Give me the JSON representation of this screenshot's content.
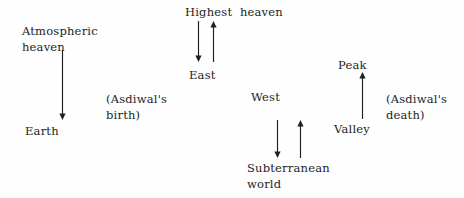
{
  "diagram": {
    "title_text": "",
    "background_color": "#fefefe",
    "ink_color": "#1d1d1d",
    "labels": [
      {
        "id": "atmospheric_heaven",
        "text": "Atmospheric\nheaven",
        "x": 22,
        "y": 24
      },
      {
        "id": "earth",
        "text": "Earth",
        "x": 25,
        "y": 124
      },
      {
        "id": "highest_heaven",
        "text": "Highest  heaven",
        "x": 185,
        "y": 5
      },
      {
        "id": "east",
        "text": "East",
        "x": 189,
        "y": 68
      },
      {
        "id": "asdiwal_birth",
        "text": "(Asdiwal's\nbirth)",
        "x": 106,
        "y": 92
      },
      {
        "id": "west",
        "text": "West",
        "x": 251,
        "y": 90
      },
      {
        "id": "subterranean_world",
        "text": "Subterranean\nworld",
        "x": 247,
        "y": 161
      },
      {
        "id": "peak",
        "text": "Peak",
        "x": 338,
        "y": 58
      },
      {
        "id": "valley",
        "text": "Valley",
        "x": 334,
        "y": 122
      },
      {
        "id": "asdiwal_death",
        "text": "(Asdiwal's\ndeath)",
        "x": 386,
        "y": 92
      }
    ],
    "arrows": [
      {
        "id": "atmospheric-heaven-to-earth",
        "direction": "down",
        "x": 62,
        "y_top": 50,
        "y_bottom": 120
      },
      {
        "id": "highest-heaven-to-east",
        "direction": "down",
        "x": 198,
        "y_top": 21,
        "y_bottom": 62
      },
      {
        "id": "east-to-highest-heaven",
        "direction": "up",
        "x": 213,
        "y_top": 21,
        "y_bottom": 62
      },
      {
        "id": "west-to-subterranean-world",
        "direction": "down",
        "x": 277,
        "y_top": 120,
        "y_bottom": 158
      },
      {
        "id": "subterranean-world-to-west",
        "direction": "up",
        "x": 300,
        "y_top": 120,
        "y_bottom": 158
      },
      {
        "id": "valley-to-peak",
        "direction": "up",
        "x": 362,
        "y_top": 72,
        "y_bottom": 119
      }
    ]
  }
}
